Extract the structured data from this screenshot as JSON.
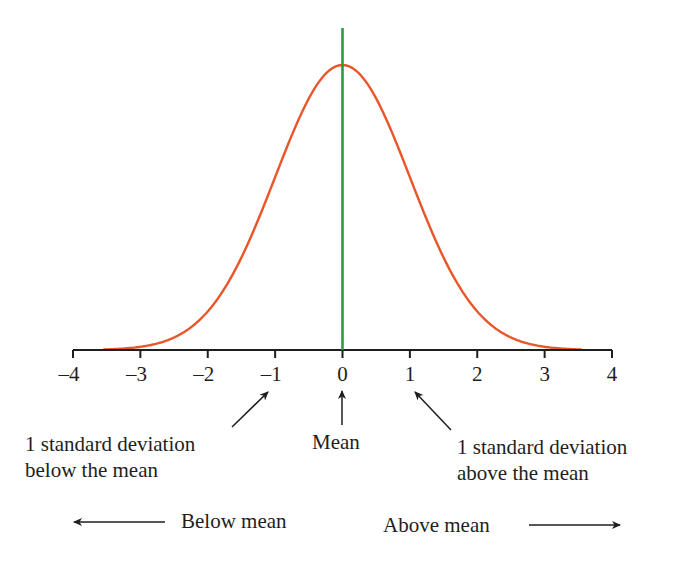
{
  "chart_data": {
    "type": "line",
    "title": "",
    "xlabel": "",
    "ylabel": "",
    "xlim": [
      -4,
      4
    ],
    "x_ticks": [
      -4,
      -3,
      -2,
      -1,
      0,
      1,
      2,
      3,
      4
    ],
    "x_tick_labels": [
      "–4",
      "–3",
      "–2",
      "–1",
      "0",
      "1",
      "2",
      "3",
      "4"
    ],
    "series": [
      {
        "name": "normal curve",
        "color": "#e8562a",
        "mean": 0,
        "sd": 1,
        "x_range": [
          -3.55,
          3.55
        ]
      }
    ],
    "mean_line": {
      "x": 0,
      "color": "#2e9a3c"
    },
    "annotations": [
      {
        "text": "1 standard deviation below the mean",
        "points_to": -1
      },
      {
        "text": "Mean",
        "points_to": 0
      },
      {
        "text": "1 standard deviation above the mean",
        "points_to": 1
      },
      {
        "text": "Below mean",
        "direction": "left"
      },
      {
        "text": "Above mean",
        "direction": "right"
      }
    ],
    "grid": false,
    "legend": "none"
  },
  "labels": {
    "ticks": [
      "–4",
      "–3",
      "–2",
      "–1",
      "0",
      "1",
      "2",
      "3",
      "4"
    ],
    "sd_below_line1": "1 standard deviation",
    "sd_below_line2": "below the mean",
    "mean": "Mean",
    "sd_above_line1": "1 standard deviation",
    "sd_above_line2": "above the mean",
    "below_mean": "Below mean",
    "above_mean": "Above mean"
  },
  "colors": {
    "curve": "#e8562a",
    "mean_line": "#2e9a3c",
    "axis": "#1e1e1e"
  }
}
